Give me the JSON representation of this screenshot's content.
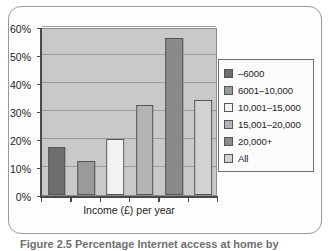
{
  "caption": "Figure 2.5 Percentage Internet access at home by",
  "chart_data": {
    "type": "bar",
    "title": "",
    "xlabel": "Income (£) per year",
    "ylabel": "",
    "categories": [
      "–6000",
      "6001–10,000",
      "10,001–15,000",
      "15,001–20,000",
      "20,000+",
      "All"
    ],
    "values": [
      17,
      12,
      20,
      32,
      56,
      34
    ],
    "ylim": [
      0,
      60
    ],
    "yticks": [
      "0%",
      "10%",
      "20%",
      "30%",
      "40%",
      "50%",
      "60%"
    ],
    "ytick_values": [
      0,
      10,
      20,
      30,
      40,
      50,
      60
    ],
    "grid": true,
    "legend_position": "right",
    "plot_background": "#c9c9c9",
    "series_colors": [
      "#6e6e6e",
      "#9a9a9a",
      "#f2f2f2",
      "#b4b4b4",
      "#8a8a8a",
      "#d2d2d2"
    ],
    "legend": [
      {
        "label": "–6000",
        "color": "#6e6e6e"
      },
      {
        "label": "6001–10,000",
        "color": "#9a9a9a"
      },
      {
        "label": "10,001–15,000",
        "color": "#f2f2f2"
      },
      {
        "label": "15,001–20,000",
        "color": "#b4b4b4"
      },
      {
        "label": "20,000+",
        "color": "#8a8a8a"
      },
      {
        "label": "All",
        "color": "#d2d2d2"
      }
    ]
  }
}
